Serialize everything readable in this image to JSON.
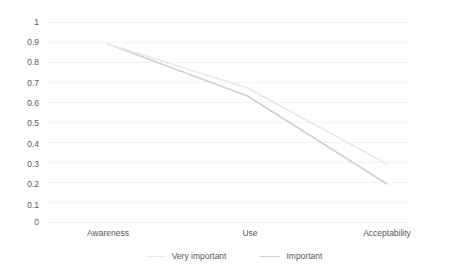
{
  "chart_data": {
    "type": "line",
    "title": "",
    "subtitle": "",
    "xlabel": "",
    "ylabel": "",
    "categories": [
      "Awareness",
      "Use",
      "Acceptability"
    ],
    "ylim": [
      0,
      1
    ],
    "yticks": [
      "0",
      "0.1",
      "0.2",
      "0.3",
      "0.4",
      "0.5",
      "0.6",
      "0.7",
      "0.8",
      "0.9",
      "1"
    ],
    "grid": true,
    "legend_position": "bottom",
    "series": [
      {
        "name": "Very important",
        "values": [
          0.89,
          0.67,
          0.29
        ],
        "color": "#e8e8e8"
      },
      {
        "name": "Important",
        "values": [
          0.89,
          0.63,
          0.19
        ],
        "color": "#d0d0d0"
      }
    ]
  }
}
